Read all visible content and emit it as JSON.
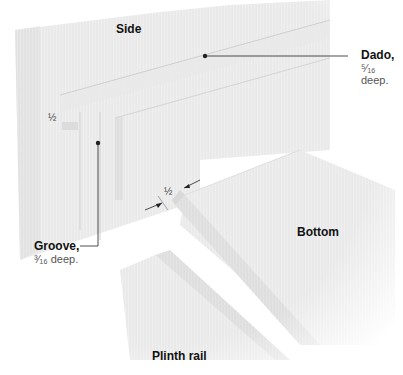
{
  "diagram": {
    "labels": {
      "side": "Side",
      "dado": "Dado,",
      "dado_depth": "⁵⁄₁₆ deep.",
      "groove": "Groove,",
      "groove_depth": "³⁄₁₆ deep.",
      "bottom": "Bottom",
      "plinth_rail": "Plinth rail",
      "dim_left": "½",
      "dim_gap": "½"
    },
    "colors": {
      "wood_light": "#f2f2f2",
      "wood_mid": "#e6e6e6",
      "wood_dark": "#d6d6d6",
      "leader": "#222222"
    }
  }
}
